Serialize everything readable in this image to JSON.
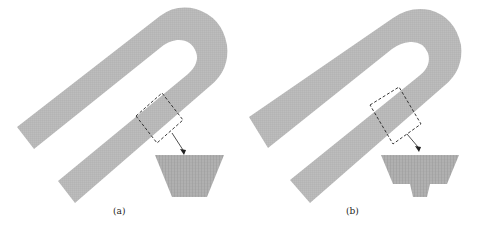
{
  "figure": {
    "panels": [
      {
        "id": "a",
        "label": "(a)",
        "inset": "trapezoid-mesh"
      },
      {
        "id": "b",
        "label": "(b)",
        "inset": "trapezoid-with-stem-mesh"
      }
    ],
    "colors": {
      "mesh_fill": "#b9b9b9",
      "mesh_line": "#9a9a9a",
      "inset_fill": "#a9a9a9",
      "box_stroke": "#222222",
      "arrow": "#222222"
    }
  }
}
